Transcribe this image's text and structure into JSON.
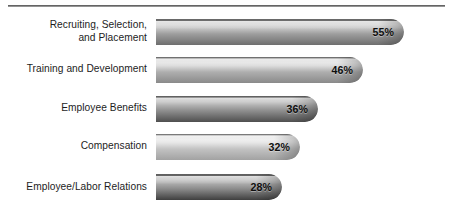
{
  "chart_data": {
    "type": "bar",
    "orientation": "horizontal",
    "title": "",
    "subtitle": "",
    "xlabel": "",
    "ylabel": "",
    "xlim": [
      0,
      60
    ],
    "grid": false,
    "legend": null,
    "value_suffix": "%",
    "categories": [
      "Recruiting, Selection,\nand Placement",
      "Training and Development",
      "Employee Benefits",
      "Compensation",
      "Employee/Labor Relations"
    ],
    "values": [
      55,
      46,
      36,
      32,
      28
    ],
    "value_labels": [
      "55%",
      "46%",
      "36%",
      "32%",
      "28%"
    ],
    "bar_styles": [
      {
        "top": "#9d9d9d",
        "mid": "#c9c9c9",
        "bottom": "#6e6e6e"
      },
      {
        "top": "#aeaeae",
        "mid": "#dcdcdc",
        "bottom": "#8a8a8a"
      },
      {
        "top": "#8c8c8c",
        "mid": "#b4b4b4",
        "bottom": "#4f4f4f"
      },
      {
        "top": "#c2c2c2",
        "mid": "#e6e6e6",
        "bottom": "#a2a2a2"
      },
      {
        "top": "#8a8a8a",
        "mid": "#b0b0b0",
        "bottom": "#3f3f3f"
      }
    ]
  },
  "rule": {
    "visible": true
  }
}
